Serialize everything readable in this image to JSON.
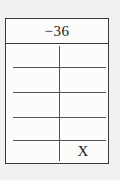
{
  "figure": {
    "header_value": "−36",
    "x_mark": "X"
  },
  "colors": {
    "page_bg": "#f1f1ef",
    "table_bg": "#fcfcfb",
    "border": "#383838",
    "grid_line": "#555555",
    "text": "#1d1d1d"
  }
}
